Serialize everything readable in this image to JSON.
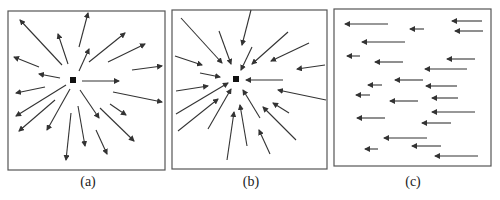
{
  "figure": {
    "stroke_color": "#333333",
    "frame_color": "#555555",
    "panels": [
      {
        "id": "a",
        "caption": "(a)",
        "description": "Source: vectors radiating outward from central point",
        "frame": [
          8,
          11,
          157,
          159
        ],
        "center": [
          73,
          80
        ],
        "arrows": [
          [
            62,
            65,
            20,
            20
          ],
          [
            68,
            64,
            58,
            34
          ],
          [
            79,
            47,
            88,
            13
          ],
          [
            79,
            71,
            89,
            49
          ],
          [
            60,
            78,
            39,
            74
          ],
          [
            39,
            67,
            14,
            57
          ],
          [
            89,
            62,
            125,
            33
          ],
          [
            108,
            62,
            145,
            44
          ],
          [
            132,
            70,
            162,
            66
          ],
          [
            82,
            81,
            119,
            81
          ],
          [
            113,
            92,
            162,
            102
          ],
          [
            45,
            87,
            16,
            93
          ],
          [
            66,
            85,
            16,
            116
          ],
          [
            55,
            100,
            19,
            131
          ],
          [
            70,
            89,
            47,
            130
          ],
          [
            71,
            113,
            66,
            160
          ],
          [
            78,
            106,
            85,
            146
          ],
          [
            80,
            90,
            99,
            118
          ],
          [
            110,
            104,
            126,
            115
          ],
          [
            100,
            108,
            134,
            141
          ],
          [
            96,
            130,
            107,
            154
          ]
        ]
      },
      {
        "id": "b",
        "caption": "(b)",
        "description": "Sink: vectors converging inward toward central point",
        "frame": [
          172,
          10,
          155,
          159
        ],
        "center": [
          236,
          79
        ],
        "arrows": [
          [
            181,
            18,
            222,
            63
          ],
          [
            219,
            31,
            231,
            64
          ],
          [
            251,
            10,
            242,
            45
          ],
          [
            252,
            47,
            241,
            70
          ],
          [
            288,
            32,
            252,
            64
          ],
          [
            309,
            43,
            271,
            61
          ],
          [
            325,
            65,
            297,
            69
          ],
          [
            175,
            56,
            202,
            65
          ],
          [
            200,
            73,
            220,
            77
          ],
          [
            283,
            80,
            246,
            80
          ],
          [
            326,
            100,
            278,
            90
          ],
          [
            176,
            91,
            208,
            86
          ],
          [
            176,
            114,
            228,
            83
          ],
          [
            178,
            131,
            218,
            99
          ],
          [
            208,
            129,
            231,
            89
          ],
          [
            227,
            160,
            234,
            112
          ],
          [
            247,
            146,
            240,
            105
          ],
          [
            260,
            118,
            243,
            90
          ],
          [
            289,
            113,
            273,
            103
          ],
          [
            296,
            140,
            263,
            107
          ],
          [
            270,
            154,
            259,
            130
          ]
        ]
      },
      {
        "id": "c",
        "caption": "(c)",
        "description": "Uniform field: parallel vectors all pointing left",
        "frame": [
          334,
          9,
          157,
          157
        ],
        "arrows": [
          [
            388,
            24,
            345,
            24
          ],
          [
            482,
            21,
            452,
            21
          ],
          [
            424,
            29,
            410,
            29
          ],
          [
            483,
            31,
            455,
            31
          ],
          [
            405,
            42,
            362,
            42
          ],
          [
            360,
            56,
            347,
            56
          ],
          [
            403,
            62,
            375,
            62
          ],
          [
            475,
            59,
            447,
            59
          ],
          [
            467,
            69,
            425,
            69
          ],
          [
            423,
            80,
            395,
            80
          ],
          [
            382,
            85,
            368,
            85
          ],
          [
            457,
            86,
            426,
            86
          ],
          [
            370,
            95,
            356,
            95
          ],
          [
            418,
            101,
            390,
            101
          ],
          [
            458,
            98,
            432,
            98
          ],
          [
            475,
            112,
            432,
            112
          ],
          [
            385,
            118,
            357,
            118
          ],
          [
            451,
            123,
            422,
            123
          ],
          [
            427,
            138,
            384,
            138
          ],
          [
            441,
            146,
            412,
            146
          ],
          [
            378,
            149,
            365,
            149
          ],
          [
            478,
            156,
            435,
            156
          ]
        ]
      }
    ]
  }
}
